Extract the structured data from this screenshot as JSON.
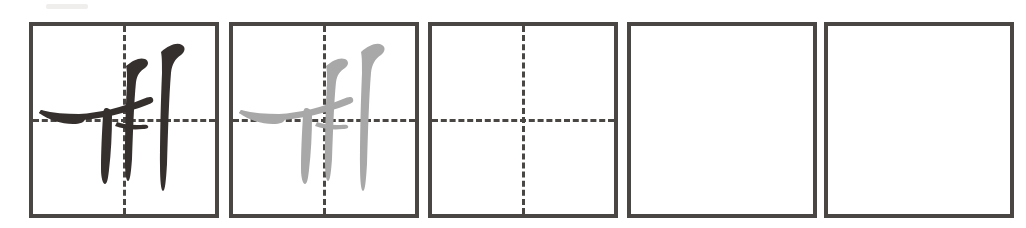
{
  "worksheet": {
    "type": "hangul-handwriting-practice",
    "title": "",
    "syllable": "ㅞ",
    "romanization": "we",
    "script": "Hangul",
    "cell_count": 5,
    "colors": {
      "ink_dark": "#35302e",
      "ink_trace_gray": "#a8a8a8",
      "cell_border": "#4a4644",
      "guide_line": "#4a4644",
      "background": "#ffffff"
    },
    "cells": [
      {
        "index": 1,
        "name": "model-cell",
        "glyph": "ㅞ",
        "glyph_style": "solid-dark",
        "glyph_color": "#35302e",
        "has_guides": true,
        "guides": [
          "vertical-center",
          "horizontal-center"
        ],
        "empty": false
      },
      {
        "index": 2,
        "name": "tracing-cell",
        "glyph": "ㅞ",
        "glyph_style": "gray-trace",
        "glyph_color": "#a8a8a8",
        "has_guides": true,
        "guides": [
          "vertical-center",
          "horizontal-center"
        ],
        "empty": false
      },
      {
        "index": 3,
        "name": "practice-cell-guided",
        "glyph": "",
        "glyph_style": "none",
        "glyph_color": "",
        "has_guides": true,
        "guides": [
          "vertical-center",
          "horizontal-center"
        ],
        "empty": true
      },
      {
        "index": 4,
        "name": "practice-cell-blank",
        "glyph": "",
        "glyph_style": "none",
        "glyph_color": "",
        "has_guides": false,
        "guides": [],
        "empty": true
      },
      {
        "index": 5,
        "name": "practice-cell-blank",
        "glyph": "",
        "glyph_style": "none",
        "glyph_color": "",
        "has_guides": false,
        "guides": [],
        "empty": true
      }
    ]
  }
}
